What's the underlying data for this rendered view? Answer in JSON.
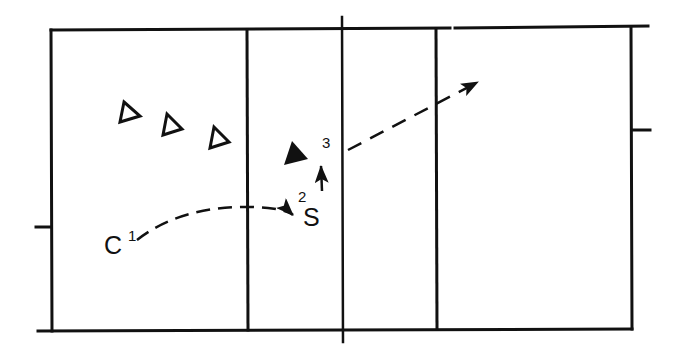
{
  "diagram": {
    "type": "volleyball-court-play-diagram",
    "colors": {
      "line": "#111111",
      "background": "#ffffff"
    },
    "labels": {
      "c": "C",
      "c_num": "1",
      "s": "S",
      "s_num": "2",
      "third": "3"
    },
    "players": [
      {
        "id": "defender-1",
        "shape": "hollow-triangle"
      },
      {
        "id": "defender-2",
        "shape": "hollow-triangle"
      },
      {
        "id": "defender-3",
        "shape": "hollow-triangle"
      },
      {
        "id": "attacker",
        "shape": "filled-triangle"
      }
    ],
    "paths": [
      {
        "id": "pass-1",
        "from": "C",
        "to": "S",
        "style": "dashed-curve-arrow"
      },
      {
        "id": "move-2",
        "from": "S",
        "to": "attacker",
        "style": "solid-arrow"
      },
      {
        "id": "attack-3",
        "from": "3",
        "to": "opponent-court",
        "style": "dashed-arrow"
      }
    ]
  }
}
